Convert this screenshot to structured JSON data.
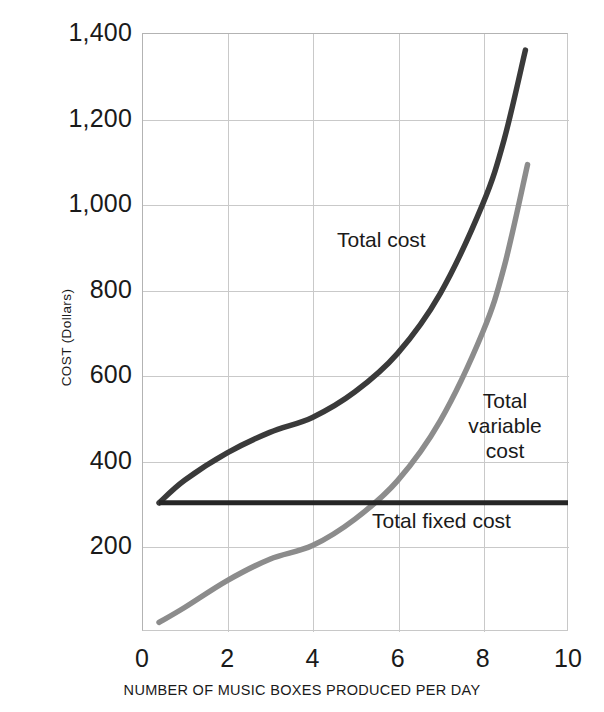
{
  "chart_data": {
    "type": "line",
    "title": "",
    "xlabel": "NUMBER OF MUSIC BOXES PRODUCED PER DAY",
    "ylabel": "COST (Dollars)",
    "xlim": [
      0,
      10
    ],
    "ylim": [
      0,
      1400
    ],
    "xticks": [
      "0",
      "2",
      "4",
      "6",
      "8",
      "10"
    ],
    "xtick_values": [
      0,
      2,
      4,
      6,
      8,
      10
    ],
    "yticks": [
      "200",
      "400",
      "600",
      "800",
      "1,000",
      "1,200",
      "1,400"
    ],
    "ytick_values": [
      200,
      400,
      600,
      800,
      1000,
      1200,
      1400
    ],
    "grid": true,
    "legend_position": "inline-annotations",
    "series": [
      {
        "name": "Total cost",
        "color": "#3a3a3a",
        "label_text": "Total cost",
        "x": [
          0.4,
          1,
          2,
          3,
          4,
          5,
          6,
          7,
          8,
          8.5,
          9.0
        ],
        "values": [
          300,
          353,
          417,
          465,
          500,
          560,
          650,
          790,
          1000,
          1150,
          1360
        ]
      },
      {
        "name": "Total variable cost",
        "color": "#8c8c8c",
        "label_text": "Total\nvariable\ncost",
        "x": [
          0.4,
          1,
          2,
          3,
          4,
          5,
          6,
          7,
          8,
          8.5,
          9.05
        ],
        "values": [
          20,
          55,
          118,
          168,
          200,
          262,
          352,
          492,
          700,
          852,
          1092
        ]
      },
      {
        "name": "Total fixed cost",
        "color": "#262626",
        "label_text": "Total fixed cost",
        "x": [
          0.4,
          10
        ],
        "values": [
          300,
          300
        ]
      }
    ]
  }
}
